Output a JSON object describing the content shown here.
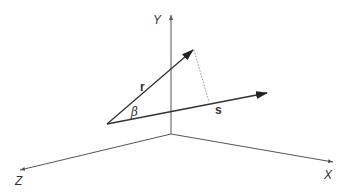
{
  "diagram": {
    "type": "3d-vector-projection",
    "axes": {
      "x_label": "X",
      "y_label": "Y",
      "z_label": "Z"
    },
    "vectors": {
      "r_label": "r",
      "s_label": "s"
    },
    "angle_label": "β",
    "colors": {
      "axis": "#555555",
      "vector": "#333333",
      "projection": "#999999",
      "background": "#ffffff"
    }
  }
}
